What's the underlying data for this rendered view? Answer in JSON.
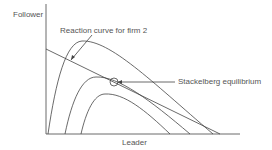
{
  "diagram": {
    "type": "economics-stackelberg",
    "labels": {
      "y_axis": "Follower",
      "x_axis": "Leader",
      "reaction_curve": "Reaction curve for firm 2",
      "equilibrium": "Stackelberg equilibrium"
    },
    "elements": {
      "axes": {
        "origin": [
          46,
          134
        ],
        "y_top": 4,
        "x_right": 240
      },
      "reaction_line": {
        "from": [
          46,
          49
        ],
        "to": [
          220,
          134
        ]
      },
      "isoprofit_curves": [
        {
          "start_x": 48,
          "peak": [
            82,
            41
          ],
          "end_x": 213
        },
        {
          "start_x": 65,
          "peak": [
            96,
            77
          ],
          "end_x": 190
        },
        {
          "start_x": 81,
          "peak": [
            105,
            94
          ],
          "end_x": 170
        }
      ],
      "equilibrium_point": [
        114,
        82
      ]
    },
    "colors": {
      "line": "#444444",
      "text": "#555555"
    }
  }
}
